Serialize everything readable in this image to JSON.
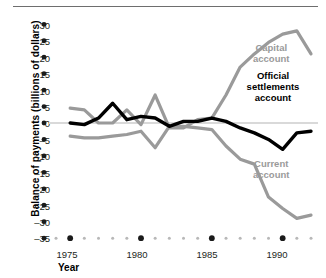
{
  "figure": {
    "top_rule": true,
    "background": "#ffffff"
  },
  "axes": {
    "y_title": "Balance of payments (billions of dollars)",
    "x_title": "Year",
    "y_ticks": [
      "30",
      "25",
      "20",
      "15",
      "10",
      "5",
      "0",
      "–5",
      "–10",
      "–15",
      "–20",
      "–25",
      "–30",
      "–35"
    ],
    "x_ticks": [
      "1975",
      "1980",
      "1985",
      "1990"
    ]
  },
  "labels": {
    "capital": "Capital\naccount",
    "capital_line1": "Capital",
    "capital_line2": "account",
    "official_line1": "Official",
    "official_line2": "settlements",
    "official_line3": "account",
    "current_line1": "Current",
    "current_line2": "account"
  },
  "colors": {
    "gray_series": "#9a9a9a",
    "black_series": "#000000",
    "zero_line": "#d9d9d9",
    "tick_major": "#1a1a1a",
    "tick_minor": "#b8b8b8",
    "rule": "#6e6e6e"
  },
  "chart_data": {
    "type": "line",
    "title": "",
    "xlabel": "Year",
    "ylabel": "Balance of payments (billions of dollars)",
    "xlim": [
      1974,
      1992
    ],
    "ylim": [
      -35,
      30
    ],
    "ytick_values": [
      30,
      25,
      20,
      15,
      10,
      5,
      0,
      -5,
      -10,
      -15,
      -20,
      -25,
      -30,
      -35
    ],
    "xtick_values": [
      1975,
      1980,
      1985,
      1990
    ],
    "grid": false,
    "legend": "inline-annotations",
    "x": [
      1975,
      1976,
      1977,
      1978,
      1979,
      1980,
      1981,
      1982,
      1983,
      1984,
      1985,
      1986,
      1987,
      1988,
      1989,
      1990,
      1991,
      1992
    ],
    "series": [
      {
        "name": "Capital account",
        "color": "#9a9a9a",
        "values": [
          4.5,
          4.0,
          0.0,
          0.0,
          4.0,
          -0.5,
          8.5,
          -1.5,
          -1.5,
          1.0,
          1.5,
          8.5,
          17.0,
          21.0,
          24.5,
          27.0,
          28.0,
          21.0
        ]
      },
      {
        "name": "Current account",
        "color": "#9a9a9a",
        "values": [
          -4.0,
          -4.5,
          -4.5,
          -4.0,
          -3.5,
          -2.5,
          -7.5,
          -1.0,
          -1.0,
          -1.5,
          -2.0,
          -7.0,
          -11.0,
          -12.5,
          -22.5,
          -26.0,
          -29.0,
          -28.0
        ]
      },
      {
        "name": "Official settlements account",
        "color": "#000000",
        "values": [
          0.0,
          -0.5,
          1.5,
          6.0,
          1.0,
          2.0,
          1.5,
          -1.0,
          0.5,
          0.5,
          1.5,
          0.5,
          -1.5,
          -3.0,
          -5.0,
          -8.0,
          -3.0,
          -2.5
        ]
      }
    ],
    "annotations": [
      {
        "text": "Capital account",
        "series": "Capital account",
        "color": "#9a9a9a"
      },
      {
        "text": "Official settlements account",
        "series": "Official settlements account",
        "color": "#000000"
      },
      {
        "text": "Current account",
        "series": "Current account",
        "color": "#9a9a9a"
      }
    ]
  }
}
